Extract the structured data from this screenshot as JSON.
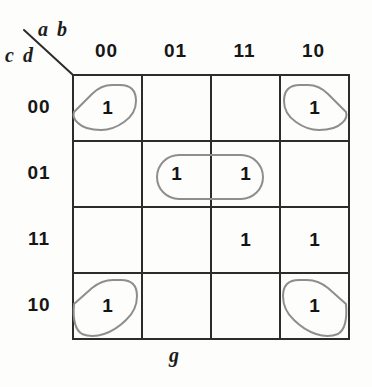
{
  "figure": {
    "caption": "g",
    "row_axis_label": "c d",
    "col_axis_label": "a b"
  },
  "chart_data": {
    "type": "table",
    "title": "g",
    "xlabel": "a b",
    "ylabel": "c d",
    "categories": [
      "00",
      "01",
      "11",
      "10"
    ],
    "row_categories": [
      "00",
      "01",
      "11",
      "10"
    ],
    "col_headers": [
      "00",
      "01",
      "11",
      "10"
    ],
    "row_headers": [
      "00",
      "01",
      "11",
      "10"
    ],
    "cells": [
      [
        "1",
        "",
        "",
        "1"
      ],
      [
        "",
        "1",
        "1",
        ""
      ],
      [
        "",
        "",
        "1",
        "1"
      ],
      [
        "1",
        "",
        "",
        "1"
      ]
    ],
    "values": [
      [
        1,
        0,
        0,
        1
      ],
      [
        0,
        1,
        1,
        0
      ],
      [
        0,
        0,
        1,
        1
      ],
      [
        1,
        0,
        0,
        1
      ]
    ],
    "groups": [
      {
        "name": "corner-group",
        "cells": [
          [
            0,
            0
          ],
          [
            0,
            3
          ],
          [
            3,
            0
          ],
          [
            3,
            3
          ]
        ],
        "color": "#8e8e8e"
      },
      {
        "name": "middle-pair-group",
        "cells": [
          [
            1,
            1
          ],
          [
            1,
            2
          ]
        ],
        "color": "#8e8e8e"
      }
    ],
    "grid": true,
    "legend": "none"
  }
}
